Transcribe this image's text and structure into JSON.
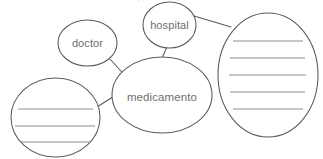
{
  "canvas": {
    "width": 323,
    "height": 159,
    "background": "#ffffff",
    "stroke_color": "#5a5a5a",
    "text_color": "#6e6e6e",
    "rule_color": "#8d8d8d"
  },
  "header": {
    "clipped_text": "mapa conceptual"
  },
  "diagram": {
    "type": "concept-map",
    "center_node": "medicamento",
    "nodes": [
      {
        "id": "doctor",
        "label": "doctor",
        "shape": "circle",
        "filled": true,
        "cx": 87.5,
        "cy": 43,
        "rx": 29.5,
        "ry": 23,
        "lines": 0
      },
      {
        "id": "hospital",
        "label": "hospital",
        "shape": "circle",
        "filled": true,
        "cx": 169.5,
        "cy": 25,
        "rx": 26.5,
        "ry": 23,
        "lines": 0
      },
      {
        "id": "medicamento",
        "label": "medicamento",
        "shape": "ellipse",
        "filled": true,
        "cx": 162,
        "cy": 95,
        "rx": 50,
        "ry": 38,
        "lines": 0
      },
      {
        "id": "blank-left",
        "label": "",
        "shape": "circle",
        "filled": false,
        "cx": 55.5,
        "cy": 117.5,
        "rx": 44.5,
        "ry": 39.5,
        "lines": 3
      },
      {
        "id": "blank-right",
        "label": "",
        "shape": "ellipse",
        "filled": false,
        "cx": 268,
        "cy": 75,
        "rx": 50,
        "ry": 62,
        "lines": 5
      }
    ],
    "edges": [
      {
        "id": "edge-doctor-medicamento",
        "from": "doctor",
        "to": "medicamento",
        "x1": 110,
        "y1": 59,
        "x2": 128,
        "y2": 79
      },
      {
        "id": "edge-hospital-medicamento",
        "from": "hospital",
        "to": "medicamento",
        "x1": 167,
        "y1": 47,
        "x2": 162,
        "y2": 58
      },
      {
        "id": "edge-blankleft-medicamento",
        "from": "blank-left",
        "to": "medicamento",
        "x1": 97,
        "y1": 107,
        "x2": 119,
        "y2": 93
      },
      {
        "id": "edge-hospital-blankright",
        "from": "hospital",
        "to": "blank-right",
        "x1": 194,
        "y1": 16,
        "x2": 230,
        "y2": 27
      }
    ]
  }
}
